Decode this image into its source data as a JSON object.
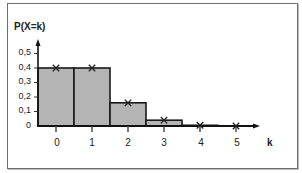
{
  "chart_data": {
    "type": "bar",
    "title": "",
    "xlabel": "k",
    "ylabel": "P(X=k)",
    "categories": [
      "0",
      "1",
      "2",
      "3",
      "4",
      "5"
    ],
    "values": [
      0.4,
      0.4,
      0.16,
      0.04,
      0.005,
      0.0
    ],
    "markers": {
      "symbol": "x",
      "values": [
        0.4,
        0.4,
        0.16,
        0.04,
        0.005,
        0.0
      ]
    },
    "y_ticks": [
      "0",
      "0,1",
      "0,2",
      "0,3",
      "0,4",
      "0,5"
    ],
    "x_ticks": [
      "0",
      "1",
      "2",
      "3",
      "4",
      "5"
    ],
    "ylim": [
      0,
      0.55
    ],
    "grid": false,
    "legend": null,
    "bar_color": "#b4b4b4",
    "bar_edge_color": "#1a1a1a"
  },
  "labels": {
    "y_axis": "P(X=k)",
    "x_axis": "k",
    "y_ticks": [
      "0",
      "0,1",
      "0,2",
      "0,3",
      "0,4",
      "0,5"
    ],
    "x_ticks": [
      "0",
      "1",
      "2",
      "3",
      "4",
      "5"
    ]
  }
}
